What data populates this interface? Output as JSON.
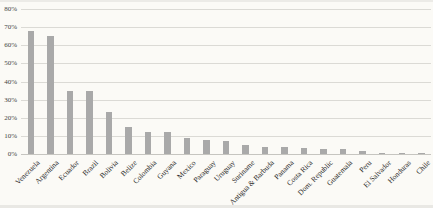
{
  "chart_data": {
    "type": "bar",
    "title": "",
    "xlabel": "",
    "ylabel": "",
    "categories": [
      "Venezuela",
      "Argentina",
      "Ecuador",
      "Brazil",
      "Bolivia",
      "Belize",
      "Colombia",
      "Guyana",
      "Mexico",
      "Paraguay",
      "Uruguay",
      "Suriname",
      "Antigua & Barbuda",
      "Panama",
      "Costa Rica",
      "Dom. Republic",
      "Guatemala",
      "Peru",
      "El Salvador",
      "Honduras",
      "Chile"
    ],
    "values": [
      68,
      65,
      35,
      35,
      23,
      15,
      12,
      12,
      9,
      8,
      7,
      5,
      4,
      4,
      3.5,
      3,
      3,
      1.5,
      0.8,
      0.6,
      0.5
    ],
    "ylim": [
      0,
      80
    ],
    "ytick_step": 10,
    "ytick_labels": [
      "0%",
      "10%",
      "20%",
      "30%",
      "40%",
      "50%",
      "60%",
      "70%",
      "80%"
    ],
    "grid": true,
    "legend_position": "none",
    "colors": {
      "bar": "#a9a9a9",
      "gridline": "#dbdad5",
      "baseline": "#c6c5c0",
      "ytick_text": "#454545",
      "xlabel_text": "#2b2b2b",
      "background": "#fbfaf6"
    }
  }
}
